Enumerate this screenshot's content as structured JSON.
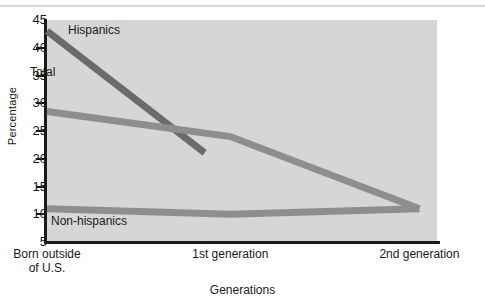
{
  "chart_data": {
    "type": "line",
    "title": "",
    "xlabel": "Generations",
    "ylabel": "Percentage",
    "categories": [
      "Born outside\nof U.S.",
      "1st generation",
      "2nd generation"
    ],
    "ylim": [
      5,
      45
    ],
    "yticks": [
      45,
      40,
      35,
      30,
      25,
      20,
      15,
      10,
      5
    ],
    "grid": false,
    "legend_position": "inline-labels",
    "series": [
      {
        "name": "Hispanics",
        "color": "#6b6b6b",
        "values": [
          43,
          17.5,
          null
        ],
        "note": "line is truncated and stops short of the 1st generation tick"
      },
      {
        "name": "Total",
        "color": "#8e8e8e",
        "values": [
          28.5,
          24,
          11
        ]
      },
      {
        "name": "Non-hispanics",
        "color": "#8e8e8e",
        "values": [
          11,
          10,
          11
        ]
      }
    ]
  },
  "axes": {
    "y_title": "Percentage",
    "x_title": "Generations",
    "y_tick_labels": [
      "45",
      "40",
      "35",
      "30",
      "25",
      "20",
      "15",
      "10",
      "5"
    ],
    "x_tick_labels": [
      "Born outside\nof U.S.",
      "1st generation",
      "2nd generation"
    ]
  },
  "series_labels": {
    "hispanics": "Hispanics",
    "total": "Total",
    "non_hispanics": "Non-hispanics"
  },
  "colors": {
    "plot_background": "#d6d6d4",
    "axis": "#1a1a1a",
    "hispanics_line": "#6b6b6b",
    "total_line": "#8e8e8e",
    "non_hispanics_line": "#8e8e8e",
    "page_background": "#ffffff"
  }
}
